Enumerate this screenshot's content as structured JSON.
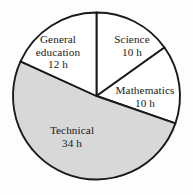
{
  "chart_data": {
    "type": "pie",
    "title": "",
    "subtitle": "",
    "xlabel": "",
    "ylabel": "",
    "unit": "h",
    "total": 66,
    "legend_position": "none",
    "grid": false,
    "labels_inside": true,
    "categories": [
      "Science",
      "Mathematics",
      "Technical",
      "General education"
    ],
    "values": [
      10,
      10,
      34,
      12
    ],
    "slices": [
      {
        "name": "Science",
        "value": 10,
        "value_text": "10 h",
        "start_angle": 0,
        "end_angle": 54.5,
        "fill": "#ffffff",
        "stroke": "#1a1a1a"
      },
      {
        "name": "Mathematics",
        "value": 10,
        "value_text": "10 h",
        "start_angle": 54.5,
        "end_angle": 109.1,
        "fill": "#ffffff",
        "stroke": "#1a1a1a"
      },
      {
        "name": "Technical",
        "value": 34,
        "value_text": "34 h",
        "start_angle": 109.1,
        "end_angle": 294.5,
        "fill": "#d8d8d8",
        "stroke": "#1a1a1a"
      },
      {
        "name": "General education",
        "value": 12,
        "value_text": "12 h",
        "start_angle": 294.5,
        "end_angle": 360,
        "fill": "#ffffff",
        "stroke": "#1a1a1a"
      }
    ],
    "geometry": {
      "center_x": 96.5,
      "center_y": 96,
      "radius": 83.5,
      "start_at_top": true,
      "direction": "clockwise"
    },
    "colors": {
      "background": "#fdfdfd",
      "outline": "#1a1a1a",
      "shaded_slice": "#d8d8d8",
      "plain_slice": "#ffffff",
      "text": "#1a1a1a"
    }
  },
  "labels": {
    "general_education": {
      "name": "General education",
      "value_text": "12 h"
    },
    "science": {
      "name": "Science",
      "value_text": "10 h"
    },
    "mathematics": {
      "name": "Mathematics",
      "value_text": "10 h"
    },
    "technical": {
      "name": "Technical",
      "value_text": "34 h"
    }
  }
}
